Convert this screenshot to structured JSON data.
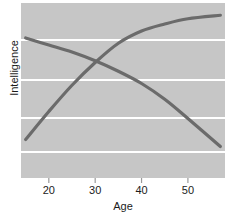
{
  "chart_data": {
    "type": "line",
    "title": "",
    "subtitle": "",
    "xlabel": "Age",
    "ylabel": "Intelligence",
    "xlim": [
      14,
      58
    ],
    "ylim": [
      0,
      100
    ],
    "xticks": [
      20,
      30,
      40,
      50
    ],
    "xtick_labels": [
      "20",
      "30",
      "40",
      "50"
    ],
    "yticks": [],
    "ytick_labels": [],
    "grid": "horizontal",
    "grid_color": "#ffffff",
    "plot_background": "#c6c6c6",
    "figure_background": "#ffffff",
    "legend": "none",
    "annotations": [],
    "series": [
      {
        "name": "Crystallized intelligence",
        "color": "#6b6b6b",
        "direction": "increasing",
        "x": [
          15,
          20,
          25,
          30,
          35,
          40,
          45,
          50,
          57
        ],
        "values": [
          22,
          38,
          53,
          66,
          77,
          84,
          88,
          91,
          93
        ]
      },
      {
        "name": "Fluid intelligence",
        "color": "#6b6b6b",
        "direction": "decreasing",
        "x": [
          15,
          20,
          25,
          30,
          35,
          40,
          45,
          50,
          57
        ],
        "values": [
          80,
          76,
          72,
          67,
          61,
          54,
          45,
          34,
          18
        ]
      }
    ],
    "crossing_point": {
      "x": 27,
      "y": 59
    }
  },
  "axis": {
    "x_label_text": "Age",
    "y_label_text": "Intelligence"
  }
}
